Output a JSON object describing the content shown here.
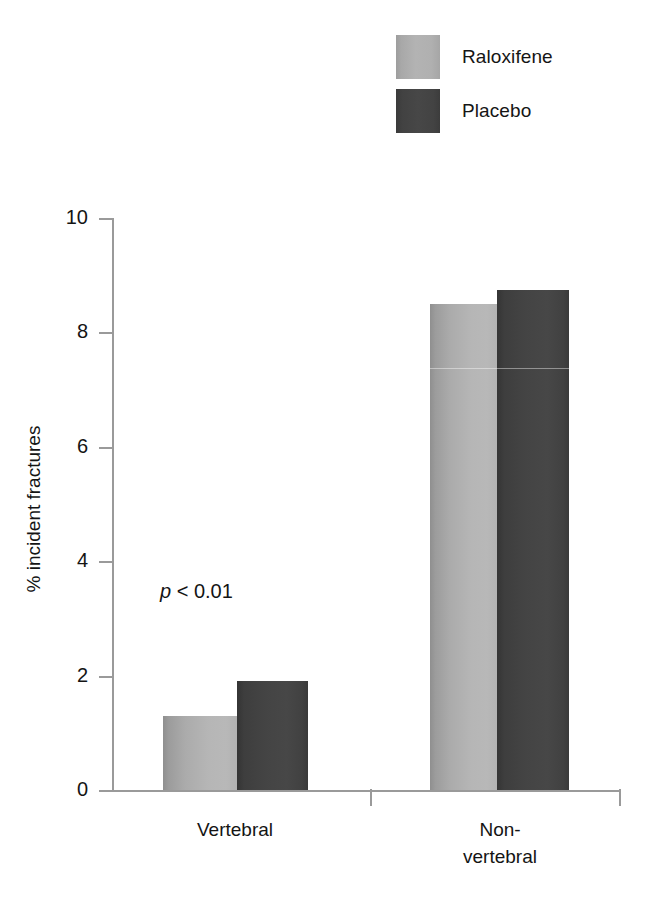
{
  "chart_data": {
    "type": "bar",
    "title": "",
    "subtitle": "",
    "xlabel": "",
    "ylabel": "% incident fractures",
    "categories": [
      "Vertebral",
      "Non-vertebral"
    ],
    "category_labels_multiline": [
      [
        "Vertebral"
      ],
      [
        "Non-",
        "vertebral"
      ]
    ],
    "series": [
      {
        "name": "Raloxifene",
        "values": [
          1.3,
          8.5
        ],
        "color": "#b0b0b0"
      },
      {
        "name": "Placebo",
        "values": [
          1.9,
          8.75
        ],
        "color": "#434343"
      }
    ],
    "ylim": [
      0,
      10
    ],
    "yticks": [
      0,
      2,
      4,
      6,
      8,
      10
    ],
    "ytick_labels": [
      "0",
      "2",
      "4",
      "6",
      "8",
      "10"
    ],
    "grid": false,
    "legend_position": "top-right",
    "annotations": [
      {
        "text": "p < 0.01",
        "italic_prefix": "p",
        "rest": " < 0.01",
        "group": "Vertebral"
      }
    ]
  },
  "legend": {
    "items": [
      {
        "label": "Raloxifene",
        "swatch": "light-gray-swatch",
        "color": "#b0b0b0"
      },
      {
        "label": "Placebo",
        "swatch": "dark-gray-swatch",
        "color": "#434343"
      }
    ]
  },
  "axes": {
    "y_title": "% incident fractures",
    "y_tick_labels": [
      "10",
      "8",
      "6",
      "4",
      "2",
      "0"
    ],
    "x_group_1_line1": "Vertebral",
    "x_group_2_line1": "Non-",
    "x_group_2_line2": "vertebral"
  },
  "annotation": {
    "p_italic": "p",
    "p_rest": " < 0.01"
  },
  "colors": {
    "raloxifene": "#b0b0b0",
    "placebo": "#434343",
    "axis": "#9a9a9a",
    "text": "#141414",
    "background": "#ffffff"
  }
}
